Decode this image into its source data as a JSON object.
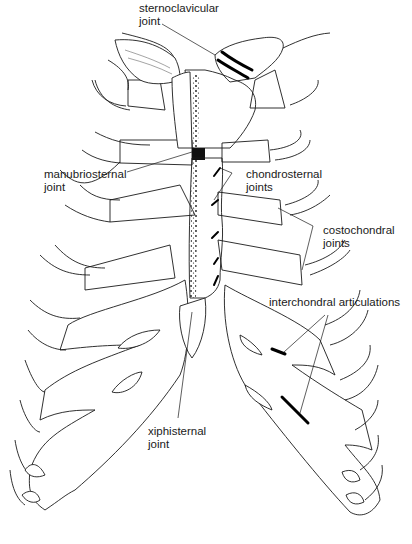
{
  "figure": {
    "labels": {
      "sternoclavicular": "sternoclavicular\njoint",
      "manubriosternal": "manubriosternal\njoint",
      "chondrosternal": "chondrosternal\njoints",
      "costochondral": "costochondral\njoints",
      "interchondral": "interchondral articulations",
      "xiphisternal": "xiphisternal\njoint"
    },
    "colors": {
      "line": "#1a1a1a",
      "background": "#ffffff"
    }
  }
}
